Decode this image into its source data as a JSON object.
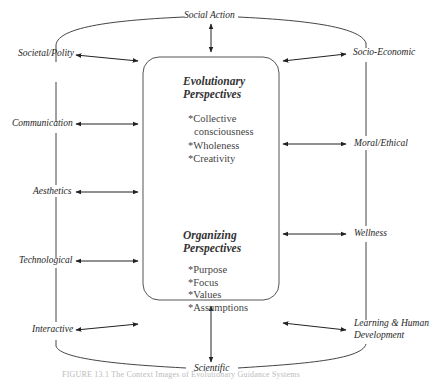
{
  "diagram": {
    "center_box": {
      "evolutionary": {
        "title_line1": "Evolutionary",
        "title_line2": "Perspectives",
        "items": [
          "*Collective",
          "consciousness",
          "*Wholeness",
          "*Creativity"
        ]
      },
      "organizing": {
        "title_line1": "Organizing",
        "title_line2": "Perspectives",
        "items": [
          "*Purpose",
          "*Focus",
          "*Values",
          "*Assumptions"
        ]
      }
    },
    "top_label": "Social Action",
    "bottom_label": "Scientific",
    "left_labels": [
      "Societal/Polity",
      "Communication",
      "Aesthetics",
      "Technological",
      "Interactive"
    ],
    "right_labels": [
      "Socio-Economic",
      "Moral/Ethical",
      "Wellness",
      "Learning & Human",
      "Development"
    ],
    "caption": "FIGURE 13.1 The Context Images of Evolutionary Guidance Systems"
  },
  "colors": {
    "line": "#333333",
    "box_border": "#555555",
    "text": "#1e1e1e"
  }
}
